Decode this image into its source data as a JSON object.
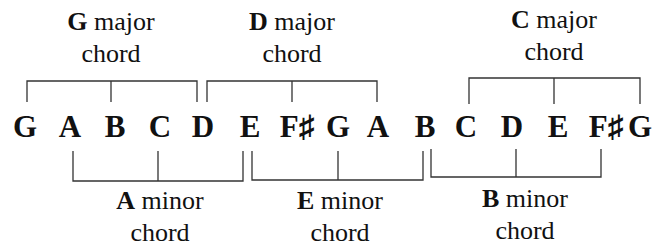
{
  "notes": [
    "G",
    "A",
    "B",
    "C",
    "D",
    "E",
    "F♯",
    "G",
    "A",
    "B",
    "C",
    "D",
    "E",
    "F♯",
    "G"
  ],
  "note_x": [
    25,
    70,
    115,
    160,
    203,
    250,
    297,
    338,
    378,
    425,
    466,
    512,
    558,
    606,
    640
  ],
  "major_chords": [
    {
      "root": "G",
      "quality": "major",
      "word": "chord",
      "notes": [
        "G",
        "B",
        "D"
      ]
    },
    {
      "root": "D",
      "quality": "major",
      "word": "chord",
      "notes": [
        "D",
        "F♯",
        "A"
      ]
    },
    {
      "root": "C",
      "quality": "major",
      "word": "chord",
      "notes": [
        "C",
        "E",
        "G"
      ]
    }
  ],
  "minor_chords": [
    {
      "root": "A",
      "quality": "minor",
      "word": "chord",
      "notes": [
        "A",
        "C",
        "E"
      ]
    },
    {
      "root": "E",
      "quality": "minor",
      "word": "chord",
      "notes": [
        "E",
        "G",
        "B"
      ]
    },
    {
      "root": "B",
      "quality": "minor",
      "word": "chord",
      "notes": [
        "B",
        "D",
        "F♯"
      ]
    }
  ],
  "colors": {
    "ink": "#111111",
    "background": "#ffffff"
  }
}
